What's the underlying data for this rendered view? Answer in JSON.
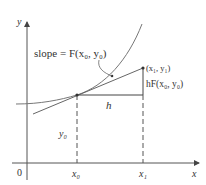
{
  "diagram": {
    "type": "euler-method-step",
    "axes": {
      "x_label": "x",
      "y_label": "y",
      "origin_label": "0"
    },
    "labels": {
      "slope": "slope = F(x₀, y₀)",
      "point1": "(x₁, y₁)",
      "rise": "hF(x₀, y₀)",
      "step": "h",
      "y0": "y₀",
      "x0": "x₀",
      "x1": "x₁"
    },
    "colors": {
      "line": "#555555",
      "text": "#333333",
      "background": "#ffffff"
    }
  }
}
